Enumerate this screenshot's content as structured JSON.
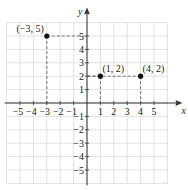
{
  "chart_data": {
    "type": "scatter",
    "title": "",
    "xlabel": "x",
    "ylabel": "y",
    "xlim": [
      -6,
      6
    ],
    "ylim": [
      -6,
      6
    ],
    "grid": true,
    "x_ticks": [
      -5,
      -4,
      -3,
      -2,
      -1,
      1,
      2,
      3,
      4,
      5
    ],
    "y_ticks": [
      5,
      4,
      3,
      2,
      1,
      -1,
      -2,
      -3,
      -4,
      -5
    ],
    "x_tick_labels": [
      "−5",
      "−4",
      "−3",
      "−2",
      "−1",
      "1",
      "2",
      "3",
      "4",
      "5"
    ],
    "y_tick_labels": [
      "5",
      "4",
      "3",
      "2",
      "1",
      "−1",
      "−2",
      "−3",
      "−4",
      "−5"
    ],
    "points": [
      {
        "x": -3,
        "y": 5,
        "label": "(−3, 5)"
      },
      {
        "x": 1,
        "y": 2,
        "label": "(1, 2)"
      },
      {
        "x": 4,
        "y": 2,
        "label": "(4, 2)"
      }
    ],
    "annotations": "Dashed projection lines from each point to the axes",
    "colors": {
      "grid": "#d9d9d9",
      "axis": "#333333",
      "point": "#111111",
      "dash": "#555555"
    }
  }
}
